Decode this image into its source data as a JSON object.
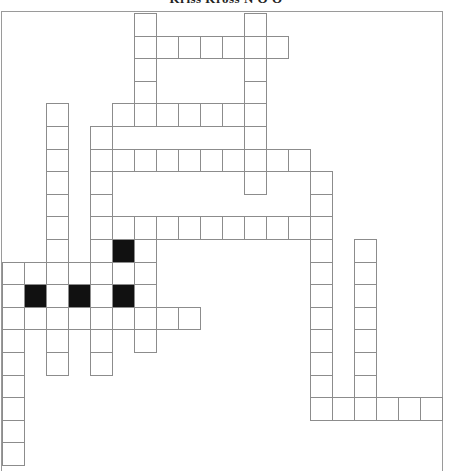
{
  "puzzle": {
    "title": "Kriss Kross N O O",
    "type": "kriss-kross crossword",
    "grid": {
      "columns": 20,
      "rows": 20,
      "cell_width": 22,
      "cell_height": 22.6,
      "origin_x": 2,
      "origin_y": 13,
      "colors": {
        "cell_fill": "#ffffff",
        "blocked_fill": "#111111",
        "line": "#8c8c8c"
      },
      "rows_cells": [
        {
          "row": 0,
          "cells": [
            6,
            11
          ],
          "blocked": []
        },
        {
          "row": 1,
          "cells": [
            6,
            7,
            8,
            9,
            10,
            11,
            12
          ],
          "blocked": []
        },
        {
          "row": 2,
          "cells": [
            6,
            11
          ],
          "blocked": []
        },
        {
          "row": 3,
          "cells": [
            6,
            11
          ],
          "blocked": []
        },
        {
          "row": 4,
          "cells": [
            2,
            5,
            6,
            7,
            8,
            9,
            10,
            11
          ],
          "blocked": []
        },
        {
          "row": 5,
          "cells": [
            2,
            4,
            11
          ],
          "blocked": []
        },
        {
          "row": 6,
          "cells": [
            2,
            4,
            5,
            6,
            7,
            8,
            9,
            10,
            11,
            12,
            13
          ],
          "blocked": []
        },
        {
          "row": 7,
          "cells": [
            2,
            4,
            11,
            14
          ],
          "blocked": []
        },
        {
          "row": 8,
          "cells": [
            2,
            4,
            14
          ],
          "blocked": []
        },
        {
          "row": 9,
          "cells": [
            2,
            4,
            5,
            6,
            7,
            8,
            9,
            10,
            11,
            12,
            13,
            14
          ],
          "blocked": []
        },
        {
          "row": 10,
          "cells": [
            2,
            4,
            5,
            6,
            14,
            16
          ],
          "blocked": [
            5
          ]
        },
        {
          "row": 11,
          "cells": [
            0,
            1,
            2,
            3,
            4,
            5,
            6,
            14,
            16
          ],
          "blocked": []
        },
        {
          "row": 12,
          "cells": [
            0,
            1,
            2,
            3,
            4,
            5,
            6,
            14,
            16
          ],
          "blocked": [
            1,
            3,
            5
          ]
        },
        {
          "row": 13,
          "cells": [
            0,
            1,
            2,
            3,
            4,
            5,
            6,
            7,
            8,
            14,
            16
          ],
          "blocked": []
        },
        {
          "row": 14,
          "cells": [
            0,
            2,
            4,
            6,
            14,
            16
          ],
          "blocked": []
        },
        {
          "row": 15,
          "cells": [
            0,
            2,
            4,
            14,
            16
          ],
          "blocked": []
        },
        {
          "row": 16,
          "cells": [
            0,
            14,
            16
          ],
          "blocked": []
        },
        {
          "row": 17,
          "cells": [
            0,
            14,
            15,
            16,
            17,
            18,
            19
          ],
          "blocked": []
        },
        {
          "row": 18,
          "cells": [
            0
          ],
          "blocked": []
        },
        {
          "row": 19,
          "cells": [
            0
          ],
          "blocked": []
        }
      ]
    }
  }
}
